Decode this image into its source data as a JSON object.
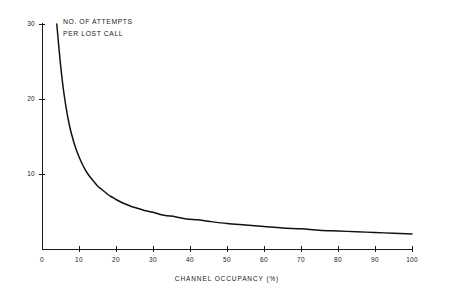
{
  "chart_data": {
    "type": "line",
    "title": "",
    "subtitle": "",
    "series_note_line1": "NO. OF ATTEMPTS",
    "series_note_line2": "PER LOST CALL",
    "xlabel": "CHANNEL OCCUPANCY (%)",
    "ylabel": "",
    "xlim": [
      0,
      100
    ],
    "ylim": [
      0,
      30
    ],
    "grid": false,
    "legend": "none",
    "x_ticks": [
      0,
      10,
      20,
      30,
      40,
      50,
      60,
      70,
      80,
      90,
      100
    ],
    "x_tick_labels": [
      "0",
      "10",
      "20",
      "30",
      "40",
      "50",
      "60",
      "70",
      "80",
      "90",
      "100"
    ],
    "y_ticks": [
      10,
      20,
      30
    ],
    "y_tick_labels": [
      "10",
      "20",
      "30"
    ],
    "series": [
      {
        "name": "No. of attempts per lost call",
        "color": "#111111",
        "x": [
          4,
          4.5,
          5,
          5.5,
          6,
          6.5,
          7,
          7.5,
          8,
          9,
          10,
          11,
          12,
          13,
          14,
          15,
          16,
          17,
          18,
          19,
          20,
          22,
          24,
          26,
          28,
          30,
          33,
          36,
          39,
          42,
          45,
          50,
          55,
          60,
          65,
          70,
          75,
          80,
          85,
          90,
          95,
          100
        ],
        "y": [
          30.0,
          27.2,
          24.6,
          22.4,
          20.5,
          18.9,
          17.5,
          16.3,
          15.3,
          13.6,
          12.3,
          11.2,
          10.3,
          9.6,
          9.0,
          8.4,
          8.0,
          7.6,
          7.2,
          6.9,
          6.6,
          6.1,
          5.7,
          5.4,
          5.1,
          4.9,
          4.5,
          4.3,
          4.0,
          3.9,
          3.7,
          3.4,
          3.2,
          3.0,
          2.8,
          2.7,
          2.5,
          2.4,
          2.3,
          2.2,
          2.1,
          2.0
        ]
      }
    ]
  },
  "plot_geometry": {
    "origin_x": 42,
    "origin_y": 249,
    "right_x": 412,
    "top_y": 24
  }
}
